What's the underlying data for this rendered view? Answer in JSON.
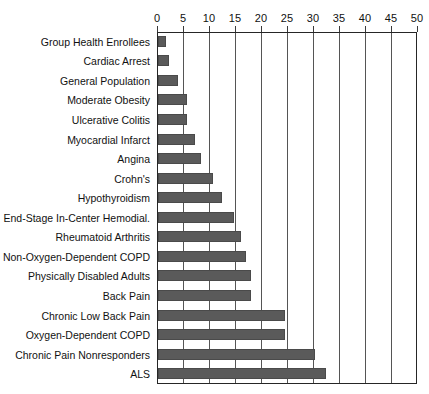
{
  "chart_data": {
    "type": "bar",
    "orientation": "horizontal",
    "title": "",
    "subtitle": "",
    "xlabel": "",
    "ylabel": "",
    "xlim": [
      0,
      50
    ],
    "xticks": [
      0,
      5,
      10,
      15,
      20,
      25,
      30,
      35,
      40,
      45,
      50
    ],
    "xtick_labels": [
      "0",
      "5",
      "10",
      "15",
      "20",
      "25",
      "30",
      "35",
      "40",
      "45",
      "50"
    ],
    "grid": "vertical",
    "legend": "none",
    "bar_color": "#5a5a5a",
    "axis_color": "#262626",
    "gridline_color": "#555555",
    "background": "#ffffff",
    "categories": [
      "Group Health Enrollees",
      "Cardiac Arrest",
      "General Population",
      "Moderate Obesity",
      "Ulcerative Colitis",
      "Myocardial Infarct",
      "Angina",
      "Crohn's",
      "Hypothyroidism",
      "End-Stage In-Center Hemodial.",
      "Rheumatoid Arthritis",
      "Non-Oxygen-Dependent COPD",
      "Physically Disabled Adults",
      "Back Pain",
      "Chronic Low Back Pain",
      "Oxygen-Dependent COPD",
      "Chronic Pain Nonresponders",
      "ALS"
    ],
    "values": [
      1.5,
      2.2,
      3.8,
      5.6,
      5.6,
      7.1,
      8.3,
      10.6,
      12.3,
      14.6,
      16.0,
      17.0,
      17.8,
      17.8,
      24.5,
      24.5,
      30.2,
      32.3
    ]
  }
}
